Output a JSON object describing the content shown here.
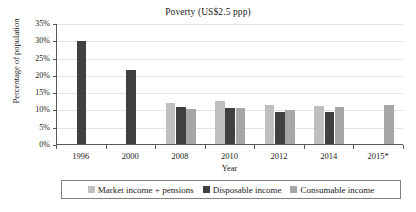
{
  "chart_data": {
    "type": "bar",
    "title": "Poverty (US$2.5 ppp)",
    "xlabel": "Year",
    "ylabel": "Percentage of population",
    "categories": [
      "1996",
      "2000",
      "2008",
      "2010",
      "2012",
      "2014",
      "2015*"
    ],
    "ylim": [
      0,
      35
    ],
    "ytick_labels": [
      "0%",
      "5%",
      "10%",
      "15%",
      "20%",
      "25%",
      "30%",
      "35%"
    ],
    "ytick_values": [
      0,
      5,
      10,
      15,
      20,
      25,
      30,
      35
    ],
    "grid": true,
    "legend_position": "bottom",
    "series": [
      {
        "name": "Market income + pensions",
        "color": "#bfbfbf",
        "values": [
          null,
          null,
          12.0,
          12.3,
          11.2,
          11.1,
          null
        ]
      },
      {
        "name": "Disposable income",
        "color": "#404040",
        "values": [
          29.9,
          21.5,
          10.7,
          10.5,
          9.3,
          9.2,
          null
        ]
      },
      {
        "name": "Consumable income",
        "color": "#a6a6a6",
        "values": [
          null,
          null,
          10.0,
          10.4,
          9.9,
          10.7,
          11.2
        ]
      }
    ]
  },
  "legend": {
    "items": [
      {
        "label": "Market income + pensions",
        "color": "#bfbfbf"
      },
      {
        "label": "Disposable income",
        "color": "#404040"
      },
      {
        "label": "Consumable income",
        "color": "#a6a6a6"
      }
    ]
  }
}
